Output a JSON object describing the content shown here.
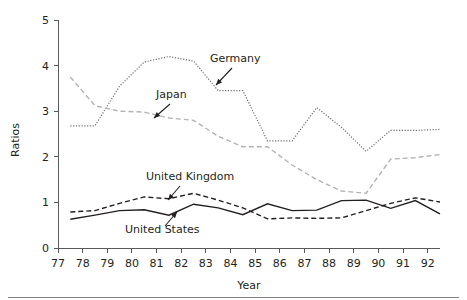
{
  "figure": {
    "width": 467,
    "height": 300,
    "background": "#ffffff",
    "bottom_rule_color": "#808285"
  },
  "chart_data": {
    "type": "line",
    "title": "",
    "subtitle": "",
    "xlabel": "Year",
    "ylabel": "Ratios",
    "xlim": [
      77,
      92.5
    ],
    "ylim": [
      0,
      5
    ],
    "grid": false,
    "legend_position": "inline-annotations",
    "xticks": [
      "77",
      "78",
      "79",
      "80",
      "81",
      "82",
      "83",
      "84",
      "85",
      "86",
      "87",
      "88",
      "89",
      "90",
      "91",
      "92"
    ],
    "yticks": [
      "0",
      "1",
      "2",
      "3",
      "4",
      "5"
    ],
    "x": [
      77.5,
      78.5,
      79.5,
      80.5,
      81.5,
      82.5,
      83.5,
      84.5,
      85.5,
      86.5,
      87.5,
      88.5,
      89.5,
      90.5,
      91.5,
      92.5
    ],
    "series": [
      {
        "name": "Germany",
        "style": "dotted",
        "color": "#6d6e71",
        "values": [
          2.68,
          2.68,
          3.55,
          4.08,
          4.2,
          4.1,
          3.45,
          3.45,
          2.35,
          2.35,
          3.08,
          2.65,
          2.12,
          2.58,
          2.58,
          2.6
        ]
      },
      {
        "name": "Japan",
        "style": "dashed",
        "color": "#b3b3b3",
        "values": [
          3.75,
          3.12,
          3.0,
          2.98,
          2.85,
          2.8,
          2.45,
          2.22,
          2.22,
          1.82,
          1.5,
          1.25,
          1.2,
          1.95,
          1.98,
          2.05
        ]
      },
      {
        "name": "United Kingdom",
        "style": "dashed",
        "color": "#231f20",
        "values": [
          0.79,
          0.82,
          0.98,
          1.12,
          1.08,
          1.2,
          1.05,
          0.88,
          0.64,
          0.66,
          0.65,
          0.66,
          0.82,
          0.98,
          1.1,
          1.01
        ]
      },
      {
        "name": "United States",
        "style": "solid",
        "color": "#231f20",
        "values": [
          0.63,
          0.72,
          0.82,
          0.84,
          0.72,
          0.96,
          0.88,
          0.73,
          0.97,
          0.82,
          0.83,
          1.04,
          1.05,
          0.87,
          1.04,
          0.75
        ]
      }
    ],
    "annotations": [
      {
        "label": "Germany",
        "text_x": 210,
        "text_y": 62,
        "arrow_from_x": 232,
        "arrow_from_y": 68,
        "arrow_to_x": 216,
        "arrow_to_y": 85
      },
      {
        "label": "Japan",
        "text_x": 156,
        "text_y": 98,
        "arrow_from_x": 170,
        "arrow_from_y": 104,
        "arrow_to_x": 154,
        "arrow_to_y": 118
      },
      {
        "label": "United Kingdom",
        "text_x": 146,
        "text_y": 180,
        "arrow_from_x": 180,
        "arrow_from_y": 186,
        "arrow_to_x": 168,
        "arrow_to_y": 200
      },
      {
        "label": "United States",
        "text_x": 125,
        "text_y": 233,
        "arrow_from_x": 165,
        "arrow_from_y": 226,
        "arrow_to_x": 177,
        "arrow_to_y": 212
      }
    ]
  }
}
